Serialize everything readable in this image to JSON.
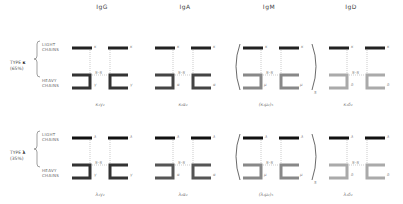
{
  "headers": [
    "IgG",
    "IgA",
    "IgM",
    "IgD"
  ],
  "row_labels": {
    "light": [
      "LIGHT",
      "CHAINS"
    ],
    "heavy": [
      "HEAVY",
      "CHAINS"
    ]
  },
  "rows": [
    {
      "type_label": "TYPE",
      "type_symbol": "κ",
      "percent": "(65%)",
      "light_letter": "κ",
      "formulas": [
        "κ₂γ₂",
        "κ₂α₂",
        "(κ₂μ₂)₅",
        "κ₂δ₂"
      ]
    },
    {
      "type_label": "TYPE",
      "type_symbol": "λ",
      "percent": "(35%)",
      "light_letter": "λ",
      "formulas": [
        "λ₂γ₂",
        "λ₂α₂",
        "(λ₂μ₂)₅",
        "λ₂δ₂"
      ]
    }
  ],
  "heavy_letters": [
    "γ",
    "α",
    "μ",
    "δ"
  ],
  "disulfide_label": "S–S",
  "pentamer_subscript": "5",
  "colors": {
    "light_chain": "#222222",
    "igg_heavy": "#333333",
    "iga_heavy": "#444444",
    "igm_heavy": "#888888",
    "igd_heavy": "#aaaaaa",
    "text": "#555555"
  }
}
